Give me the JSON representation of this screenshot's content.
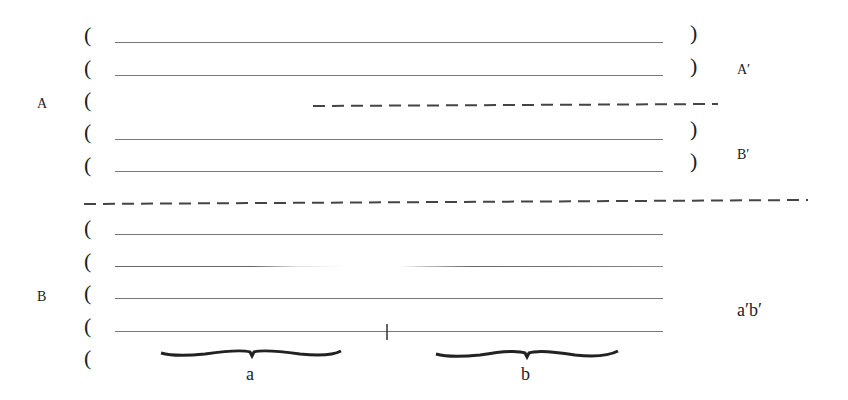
{
  "diagram": {
    "group_labels": {
      "upper": "A",
      "lower": "B"
    },
    "right_labels": {
      "a_prime": "A′",
      "b_prime": "B′",
      "ab_prime": "a′b′"
    },
    "brace_labels": {
      "left": "a",
      "right": "b"
    },
    "paren_open": "(",
    "paren_close": ")",
    "colors": {
      "ink": "#222222",
      "rule": "#777777",
      "dash": "#444444"
    }
  }
}
